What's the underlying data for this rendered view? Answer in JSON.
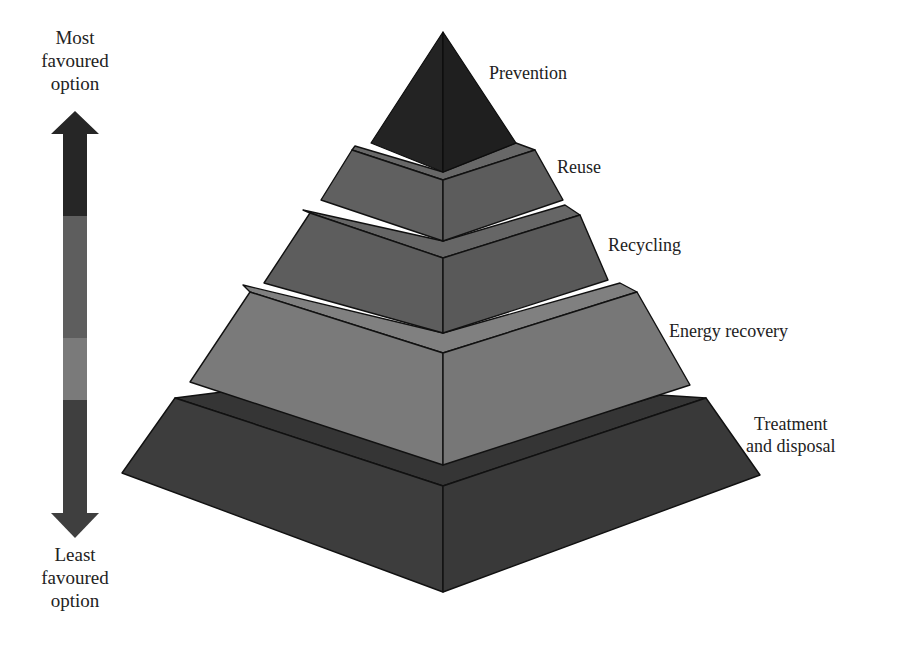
{
  "diagram": {
    "type": "waste-hierarchy-pyramid",
    "scale": {
      "top_label_lines": [
        "Most",
        "favoured",
        "option"
      ],
      "bottom_label_lines": [
        "Least",
        "favoured",
        "option"
      ],
      "arrow_segments": [
        {
          "level": "Prevention",
          "color": "#262626"
        },
        {
          "level": "Reuse / Recycling",
          "color": "#5e5e5e"
        },
        {
          "level": "Energy recovery",
          "color": "#7a7a7a"
        },
        {
          "level": "Treatment and disposal",
          "color": "#3f3f3f"
        }
      ]
    },
    "tiers": [
      {
        "label": "Prevention",
        "order": 1,
        "color_left": "#232323",
        "color_right": "#1f1f1f"
      },
      {
        "label": "Reuse",
        "order": 2,
        "color_left": "#606060",
        "color_right": "#5c5c5c"
      },
      {
        "label": "Recycling",
        "order": 3,
        "color_left": "#5d5d5d",
        "color_right": "#595959"
      },
      {
        "label": "Energy recovery",
        "order": 4,
        "color_left": "#7a7a7a",
        "color_right": "#777777"
      },
      {
        "label": "Treatment",
        "label_line2": "and disposal",
        "order": 5,
        "color_left": "#3d3d3d",
        "color_right": "#393939"
      }
    ]
  }
}
